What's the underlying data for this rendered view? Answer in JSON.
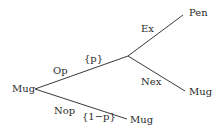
{
  "diagram": {
    "type": "decision-tree",
    "line_color": "#3a3a3a",
    "text_color": "#2a2a2a",
    "nodes": {
      "root": {
        "label": "Mug"
      },
      "branch": {
        "label": ""
      },
      "pen": {
        "label": "Pen"
      },
      "mug_nex": {
        "label": "Mug"
      },
      "mug_nop": {
        "label": "Mug"
      }
    },
    "edges": {
      "op": {
        "label": "Op",
        "prob": "{p}"
      },
      "nop": {
        "label": "Nop",
        "prob": "{1−p}"
      },
      "ex": {
        "label": "Ex"
      },
      "nex": {
        "label": "Nex"
      }
    }
  }
}
